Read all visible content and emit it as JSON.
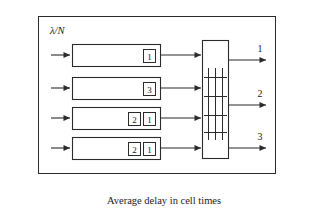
{
  "figure": {
    "title_label": "λ/N",
    "title_label_lambda": "λ",
    "title_label_slash_n": "/N",
    "caption": "Average delay in cell times",
    "line_color": "#2b2b2b",
    "background_color": "#ffffff",
    "text_color": "#1a1a1a"
  },
  "queues": [
    {
      "id": "queue-1",
      "input_arrow": "input-arrow-1",
      "cells": [
        "1"
      ],
      "output_arrow": "queue-output-arrow-1"
    },
    {
      "id": "queue-2",
      "input_arrow": "input-arrow-2",
      "cells": [
        "3"
      ],
      "output_arrow": "queue-output-arrow-2"
    },
    {
      "id": "queue-3",
      "input_arrow": "input-arrow-3",
      "cells": [
        "2",
        "1"
      ],
      "output_arrow": "queue-output-arrow-3"
    },
    {
      "id": "queue-4",
      "input_arrow": "input-arrow-4",
      "cells": [
        "2",
        "1"
      ],
      "output_arrow": "queue-output-arrow-4"
    }
  ],
  "switch_fabric": {
    "name": "crossbar-switch",
    "vertical_lines": 3,
    "horizontal_lines": 4
  },
  "outputs": [
    {
      "label": "1"
    },
    {
      "label": "2"
    },
    {
      "label": "3"
    }
  ]
}
